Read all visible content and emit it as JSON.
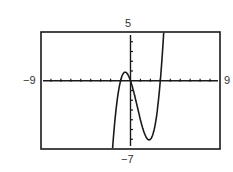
{
  "figure": {
    "part_label": ")",
    "window": {
      "xmin_label": "−9",
      "xmax_label": "9",
      "ymin_label": "−7",
      "ymax_label": "5"
    }
  },
  "chart_data": {
    "type": "line",
    "title": "",
    "xlabel": "",
    "ylabel": "",
    "xlim": [
      -9,
      9
    ],
    "ylim": [
      -7,
      5
    ],
    "xscale": 1,
    "yscale": 1,
    "grid": false,
    "legend": null,
    "tick_labels": {
      "x": [
        "-9",
        "9"
      ],
      "y": [
        "-7",
        "5"
      ]
    },
    "series": [
      {
        "name": "cubic",
        "approx_function": "y = x^3 - 2x^2 - 3x",
        "x": [
          -1.8,
          -1.5,
          -1.2,
          -1.0,
          -0.8,
          -0.535,
          -0.3,
          0,
          0.5,
          1.0,
          1.5,
          1.87,
          2.2,
          2.5,
          2.8,
          3.0,
          3.2,
          3.35
        ],
        "y": [
          -6.9,
          -3.38,
          -1.01,
          0.0,
          0.57,
          0.88,
          0.69,
          0.0,
          -1.88,
          -4.0,
          -5.63,
          -6.06,
          -5.63,
          -4.38,
          -2.13,
          0.0,
          2.69,
          5.0
        ]
      }
    ],
    "annotations": {
      "roots": [
        -1,
        0,
        3
      ],
      "local_max": [
        -0.535,
        0.88
      ],
      "local_min": [
        1.87,
        -6.06
      ]
    }
  }
}
